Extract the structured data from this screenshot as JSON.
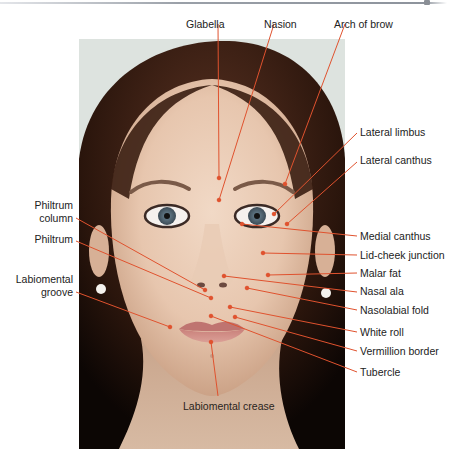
{
  "figure": {
    "type": "anatomical facial landmarks diagram",
    "leader_color": "#e0522e",
    "labels_top": [
      {
        "id": "glabella",
        "text": "Glabella"
      },
      {
        "id": "nasion",
        "text": "Nasion"
      },
      {
        "id": "arch-of-brow",
        "text": "Arch of brow"
      }
    ],
    "labels_right": [
      {
        "id": "lateral-limbus",
        "text": "Lateral limbus"
      },
      {
        "id": "lateral-canthus",
        "text": "Lateral canthus"
      },
      {
        "id": "medial-canthus",
        "text": "Medial canthus"
      },
      {
        "id": "lid-cheek-junction",
        "text": "Lid-cheek junction"
      },
      {
        "id": "malar-fat",
        "text": "Malar fat"
      },
      {
        "id": "nasal-ala",
        "text": "Nasal ala"
      },
      {
        "id": "nasolabial-fold",
        "text": "Nasolabial fold"
      },
      {
        "id": "white-roll",
        "text": "White roll"
      },
      {
        "id": "vermillion-border",
        "text": "Vermillion border"
      },
      {
        "id": "tubercle",
        "text": "Tubercle"
      }
    ],
    "labels_left": [
      {
        "id": "philtrum-column",
        "line1": "Philtrum",
        "line2": "column"
      },
      {
        "id": "philtrum",
        "text": "Philtrum"
      },
      {
        "id": "labiomental-groove",
        "line1": "Labiomental",
        "line2": "groove"
      }
    ],
    "labels_bottom": [
      {
        "id": "labiomental-crease",
        "text": "Labiomental crease"
      }
    ]
  }
}
